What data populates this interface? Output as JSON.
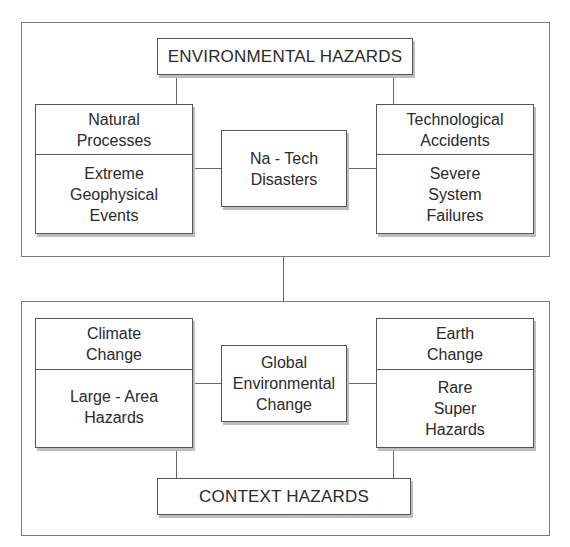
{
  "diagram": {
    "top_group": {
      "title": "ENVIRONMENTAL HAZARDS",
      "left": {
        "header": "Natural Processes",
        "header_lines": [
          "Natural",
          "Processes"
        ],
        "body_lines": [
          "Extreme",
          "Geophysical",
          "Events"
        ]
      },
      "center": {
        "lines": [
          "Na - Tech",
          "Disasters"
        ]
      },
      "right": {
        "header_lines": [
          "Technological",
          "Accidents"
        ],
        "body_lines": [
          "Severe",
          "System",
          "Failures"
        ]
      }
    },
    "bottom_group": {
      "title": "CONTEXT HAZARDS",
      "left": {
        "header_lines": [
          "Climate",
          "Change"
        ],
        "body_lines": [
          "Large - Area",
          "Hazards"
        ]
      },
      "center": {
        "lines": [
          "Global",
          "Environmental",
          "Change"
        ]
      },
      "right": {
        "header_lines": [
          "Earth",
          "Change"
        ],
        "body_lines": [
          "Rare",
          "Super",
          "Hazards"
        ]
      }
    },
    "colors": {
      "border": "#555555",
      "shadow": "#bdbdbd",
      "text": "#2a2a2a",
      "background": "#ffffff"
    }
  }
}
